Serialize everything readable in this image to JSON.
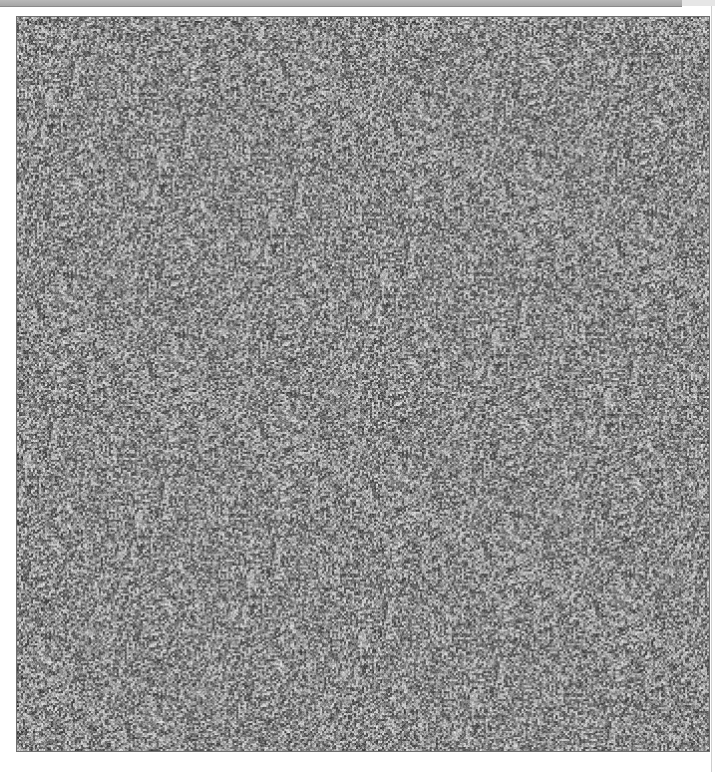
{
  "image": {
    "kind": "random-dot stereogram noise",
    "palette": {
      "dark": "#2a2a2a",
      "mid": "#8c8c8c",
      "light": "#e8e8e8",
      "border": "#6e6e6e",
      "topbar": "#a6a6a6"
    }
  }
}
